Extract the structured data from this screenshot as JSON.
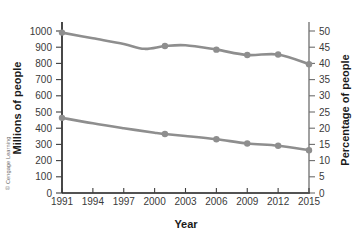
{
  "chart_data": {
    "type": "line",
    "title": "",
    "xlabel": "Year",
    "ylabel": "Millions of people",
    "y2label": "Percentage of people",
    "xlim": [
      1991,
      2015
    ],
    "ylim": [
      0,
      1000
    ],
    "y2lim": [
      0,
      50
    ],
    "grid": false,
    "legend": "none",
    "x_ticks": [
      "1991",
      "1994",
      "1997",
      "2000",
      "2003",
      "2006",
      "2009",
      "2012",
      "2015"
    ],
    "y_ticks": [
      "0",
      "100",
      "200",
      "300",
      "400",
      "500",
      "600",
      "700",
      "800",
      "900",
      "1000"
    ],
    "y2_ticks": [
      "0",
      "5",
      "10",
      "15",
      "20",
      "25",
      "30",
      "35",
      "40",
      "45",
      "50"
    ],
    "series": [
      {
        "name": "Millions of people",
        "axis": "left",
        "color": "#8e8e8e",
        "x": [
          1991,
          1994,
          1997,
          1999,
          2001,
          2003,
          2006,
          2009,
          2012,
          2015
        ],
        "values": [
          990,
          955,
          920,
          890,
          907,
          912,
          885,
          852,
          855,
          795
        ],
        "marker_x": [
          1991,
          2001,
          2006,
          2009,
          2012,
          2015
        ],
        "marker_values": [
          990,
          907,
          885,
          852,
          855,
          795
        ]
      },
      {
        "name": "Percentage of people",
        "axis": "right",
        "color": "#8e8e8e",
        "x": [
          1991,
          1994,
          1997,
          2000,
          2001,
          2003,
          2006,
          2009,
          2012,
          2015
        ],
        "values": [
          23.2,
          21.5,
          20.0,
          18.6,
          18.2,
          17.6,
          16.6,
          15.3,
          14.6,
          13.2
        ],
        "marker_x": [
          1991,
          2001,
          2006,
          2009,
          2012,
          2015
        ],
        "marker_values": [
          23.2,
          18.2,
          16.6,
          15.3,
          14.6,
          13.2
        ]
      }
    ]
  },
  "credit": {
    "text": "© Cengage Learning"
  },
  "colors": {
    "series": "#8e8e8e",
    "axis": "#1a1a1a",
    "axis_right": "#6e6e6e",
    "text": "#3a3a3a",
    "background": "#ffffff"
  }
}
